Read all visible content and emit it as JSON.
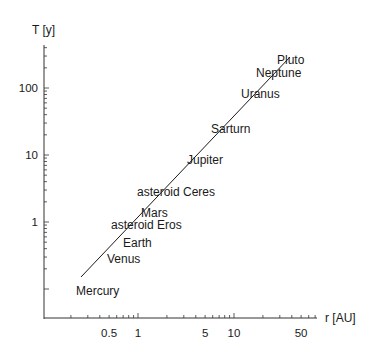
{
  "chart_data": {
    "type": "scatter",
    "title": "",
    "xlabel": "r [AU]",
    "ylabel": "T [y]",
    "xscale": "log",
    "yscale": "log",
    "xlim": [
      0.2,
      70
    ],
    "ylim": [
      0.15,
      300
    ],
    "grid": false,
    "legend": null,
    "x_ticks": [
      "0.5",
      "1",
      "5",
      "10",
      "50"
    ],
    "y_ticks": [
      "1",
      "10",
      "100"
    ],
    "points": [
      {
        "label": "Mercury",
        "r": 0.387,
        "T": 0.241
      },
      {
        "label": "Venus",
        "r": 0.723,
        "T": 0.615
      },
      {
        "label": "Earth",
        "r": 1.0,
        "T": 1.0
      },
      {
        "label": "asteroid Eros",
        "r": 1.458,
        "T": 1.76
      },
      {
        "label": "Mars",
        "r": 1.524,
        "T": 1.88
      },
      {
        "label": "asteroid Ceres",
        "r": 2.77,
        "T": 4.6
      },
      {
        "label": "Jupiter",
        "r": 5.2,
        "T": 11.86
      },
      {
        "label": "Sarturn",
        "r": 9.54,
        "T": 29.46
      },
      {
        "label": "Uranus",
        "r": 19.2,
        "T": 84.0
      },
      {
        "label": "Neptune",
        "r": 30.1,
        "T": 164.8
      },
      {
        "label": "Pluto",
        "r": 39.5,
        "T": 248.0
      }
    ],
    "fit_line": {
      "relation": "T = r^1.5",
      "r_range_drawn": [
        0.26,
        45
      ]
    }
  },
  "axes": {
    "x_label": "r [AU]",
    "y_label": "T [y]",
    "x_ticks": [
      {
        "label": "0.5",
        "v": 0.5
      },
      {
        "label": "1",
        "v": 1
      },
      {
        "label": "5",
        "v": 5
      },
      {
        "label": "10",
        "v": 10
      },
      {
        "label": "50",
        "v": 50
      }
    ],
    "y_ticks": [
      {
        "label": "1",
        "v": 1
      },
      {
        "label": "10",
        "v": 10
      },
      {
        "label": "100",
        "v": 100
      }
    ]
  },
  "labels": [
    {
      "text": "Pluto",
      "x": 277,
      "y": 64
    },
    {
      "text": "Neptune",
      "x": 256,
      "y": 77
    },
    {
      "text": "Uranus",
      "x": 241,
      "y": 98
    },
    {
      "text": "Sarturn",
      "x": 211,
      "y": 133
    },
    {
      "text": "Jupiter",
      "x": 187,
      "y": 164
    },
    {
      "text": "asteroid Ceres",
      "x": 137,
      "y": 196
    },
    {
      "text": "Mars",
      "x": 141,
      "y": 217
    },
    {
      "text": "asteroid Eros",
      "x": 111,
      "y": 229
    },
    {
      "text": "Earth",
      "x": 123,
      "y": 247
    },
    {
      "text": "Venus",
      "x": 107,
      "y": 263
    },
    {
      "text": "Mercury",
      "x": 76,
      "y": 295
    }
  ],
  "line": {
    "x1": 81,
    "y1": 277,
    "x2": 290,
    "y2": 57
  },
  "colors": {
    "ink": "#1a1a1a",
    "axis": "#333333",
    "background": "#ffffff"
  }
}
